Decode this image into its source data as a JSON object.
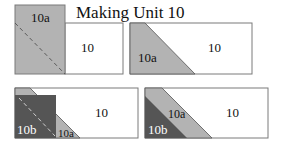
{
  "title": "Making Unit 10",
  "colors": {
    "background": "#ffffff",
    "light_gray": "#b3b3b3",
    "dark_gray": "#555555",
    "outline": "#7a7a7a",
    "dash": "#5a5a5a"
  },
  "panels": [
    {
      "id": 1,
      "labels": {
        "piece_a": "10a",
        "piece_main": "10"
      }
    },
    {
      "id": 2,
      "labels": {
        "piece_a": "10a",
        "piece_main": "10"
      }
    },
    {
      "id": 3,
      "labels": {
        "piece_b": "10b",
        "piece_a": "10a",
        "piece_main": "10"
      }
    },
    {
      "id": 4,
      "labels": {
        "piece_b": "10b",
        "piece_a": "10a",
        "piece_main": "10"
      }
    }
  ]
}
